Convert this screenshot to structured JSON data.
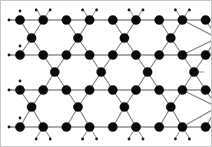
{
  "figure": {
    "title": "Kagome lattice network diagram",
    "background_color": "#ffffff",
    "frame_color": "#c8c8c8",
    "node_color": "#0a0a0a",
    "edge_color": "#8a8a8a",
    "node_radius": 4.6,
    "stub_node_radius": 1.4,
    "width": 212,
    "height": 147
  },
  "lattice": {
    "type": "kagome",
    "description": "Planar lattice of corner-sharing triangles: four dense horizontal rails of nine sites each, interleaved with rows of apex sites forming up- and down-pointing triangles.",
    "x_start": 20,
    "x_spacing": 23.2,
    "rail_rows": [
      {
        "name": "rail-row-1",
        "y": 20,
        "count": 9,
        "x_offset": 0
      },
      {
        "name": "rail-row-2",
        "y": 55,
        "count": 9,
        "x_offset": 0
      },
      {
        "name": "rail-row-3",
        "y": 90,
        "count": 9,
        "x_offset": 0
      },
      {
        "name": "rail-row-4",
        "y": 127,
        "count": 9,
        "x_offset": 0
      }
    ],
    "apex_rows": [
      {
        "name": "apex-row-1",
        "y": 38,
        "count": 5,
        "x_start": 31.6,
        "x_spacing": 46.4
      },
      {
        "name": "apex-row-2",
        "y": 72,
        "count": 4,
        "x_start": 54.8,
        "x_spacing": 46.4
      },
      {
        "name": "apex-row-3",
        "y": 107,
        "count": 5,
        "x_start": 31.6,
        "x_spacing": 46.4
      },
      {
        "name": "apex-row-4",
        "y": 113,
        "count": 4,
        "x_start": 54.8,
        "x_spacing": 46.4
      }
    ],
    "stub_rows": [
      {
        "name": "stub-row-top",
        "y": 10,
        "count": 9,
        "x_start": 20,
        "x_spacing": 23.2
      },
      {
        "name": "stub-row-bottom",
        "y": 139,
        "count": 9,
        "x_start": 20,
        "x_spacing": 23.2
      }
    ],
    "edge_count_label": "",
    "node_count_label": ""
  },
  "chart_data": {
    "type": "scatter",
    "title": "Kagome lattice",
    "xlabel": "",
    "ylabel": "",
    "xlim": [
      0,
      212
    ],
    "ylim": [
      0,
      147
    ],
    "grid": false,
    "legend": null,
    "series": [
      {
        "name": "rail-row-1",
        "y": 20,
        "x": [
          20,
          43.2,
          66.4,
          89.6,
          112.8,
          136.0,
          159.2,
          182.4,
          205.6
        ]
      },
      {
        "name": "rail-row-2",
        "y": 55,
        "x": [
          20,
          43.2,
          66.4,
          89.6,
          112.8,
          136.0,
          159.2,
          182.4,
          205.6
        ]
      },
      {
        "name": "rail-row-3",
        "y": 90,
        "x": [
          20,
          43.2,
          66.4,
          89.6,
          112.8,
          136.0,
          159.2,
          182.4,
          205.6
        ]
      },
      {
        "name": "rail-row-4",
        "y": 127,
        "x": [
          20,
          43.2,
          66.4,
          89.6,
          112.8,
          136.0,
          159.2,
          182.4,
          205.6
        ]
      },
      {
        "name": "apex-row-1",
        "y": 38,
        "x": [
          31.6,
          78.0,
          124.4,
          170.8,
          205.6
        ]
      },
      {
        "name": "apex-row-2",
        "y": 72,
        "x": [
          54.8,
          101.2,
          147.6,
          194.0
        ]
      },
      {
        "name": "apex-row-3",
        "y": 107,
        "x": [
          31.6,
          78.0,
          124.4,
          170.8,
          205.6
        ]
      }
    ]
  }
}
